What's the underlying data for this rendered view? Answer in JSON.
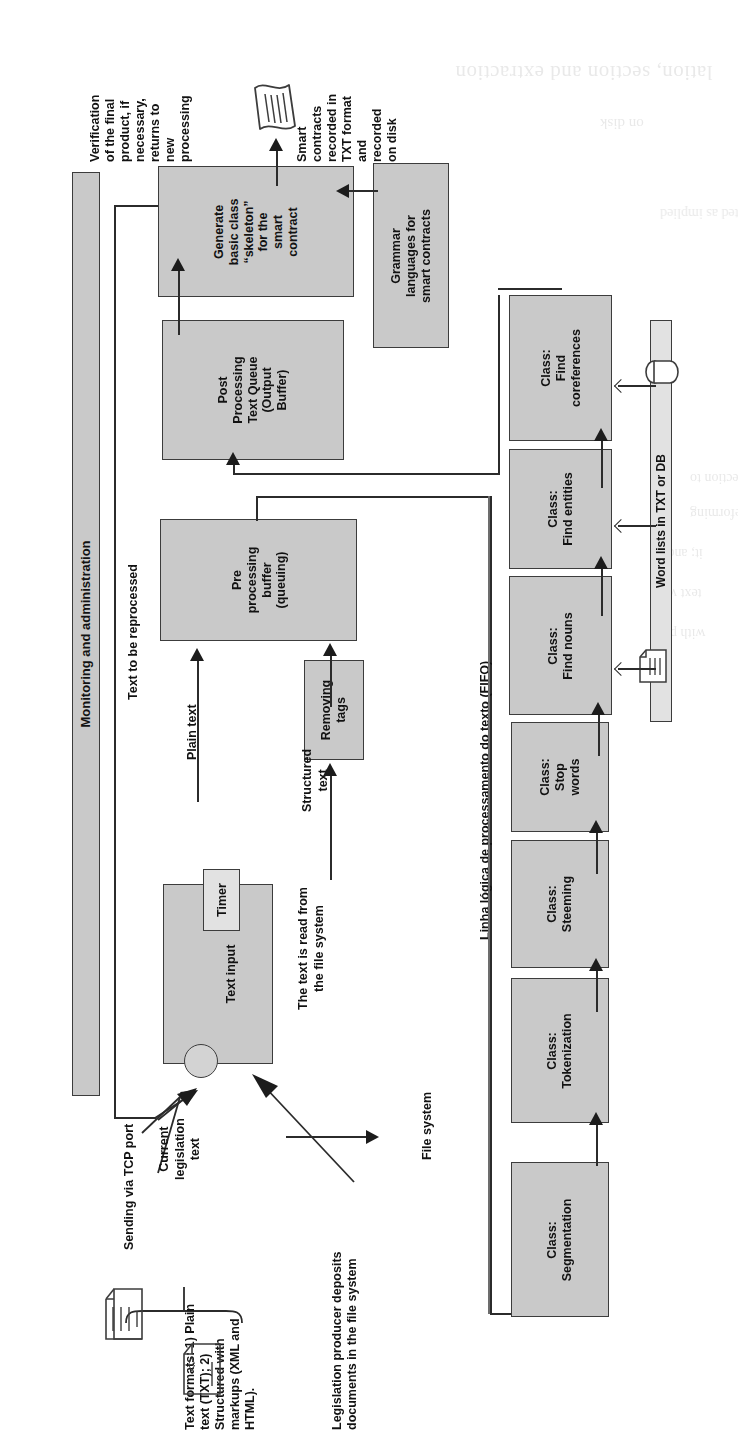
{
  "figure": {
    "orientation": "rotated-90-ccw",
    "kind": "architecture-flow-diagram",
    "colors": {
      "box_fill": "#c9c9c9",
      "box_light_fill": "#e2e2e2",
      "stroke": "#3c3c3c",
      "text": "#121212",
      "page": "#ffffff"
    }
  },
  "bands": {
    "monitoring": "Monitoring and administration",
    "word_lists": "Word lists in TXT or DB",
    "fifo_line": "Linha lógica de processamento do texto (FIFO)"
  },
  "boxes": {
    "generate_skeleton": "Generate basic class “skeleton” for the smart contract",
    "generate_skeleton_lines": [
      "Generate",
      "basic class",
      "“skeleton”",
      "for the",
      "smart",
      "contract"
    ],
    "grammar_languages_lines": [
      "Grammar",
      "languages for",
      "smart contracts"
    ],
    "post_processing_lines": [
      "Post",
      "Processing",
      "Text Queue",
      "(Output",
      "Buffer)"
    ],
    "pre_processing_lines": [
      "Pre",
      "processing",
      "buffer",
      "(queuing)"
    ],
    "removing_tags_lines": [
      "Removing",
      "tags"
    ],
    "text_input": "Text input",
    "timer": "Timer"
  },
  "classes": [
    {
      "title": "Class:",
      "name": "Find coreferences",
      "lines": [
        "Class:",
        "Find",
        "coreferences"
      ]
    },
    {
      "title": "Class:",
      "name": "Find entities",
      "lines": [
        "Class:",
        "Find entities"
      ]
    },
    {
      "title": "Class:",
      "name": "Find nouns",
      "lines": [
        "Class:",
        "Find nouns"
      ]
    },
    {
      "title": "Class:",
      "name": "Stop words",
      "lines": [
        "Class:",
        "Stop",
        "words"
      ]
    },
    {
      "title": "Class:",
      "name": "Steeming",
      "lines": [
        "Class:",
        "Steeming"
      ]
    },
    {
      "title": "Class:",
      "name": "Tokenization",
      "lines": [
        "Class:",
        "Tokenization"
      ]
    },
    {
      "title": "Class:",
      "name": "Segmentation",
      "lines": [
        "Class:",
        "Segmentation"
      ]
    }
  ],
  "annotations": {
    "verification": "Verification of the final product, if necessary, returns to new processing",
    "verification_lines": [
      "Verification",
      "of the final",
      "product, if",
      "necessary,",
      "returns to",
      "new",
      "processing"
    ],
    "smart_contracts_output": "Smart contracts recorded in TXT format and recorded on disk",
    "smart_contracts_output_lines": [
      "Smart",
      "contracts",
      "recorded in",
      "TXT format",
      "and",
      "recorded",
      "on disk"
    ],
    "text_to_be_reprocessed": "Text to be reprocessed",
    "plain_text": "Plain text",
    "structured_text_lines": [
      "Structured",
      "text"
    ],
    "text_read_from_fs_lines": [
      "The text is read from",
      "the file system"
    ],
    "sending_via_tcp": "Sending via TCP port",
    "current_legislation_text_lines": [
      "Current",
      "legislation",
      "text"
    ],
    "text_formats_lines": [
      "Text formats: 1) Plain",
      "text (TXT); 2)",
      "Structured with",
      "markups (XML and",
      "HTML)."
    ],
    "legislation_producer_lines": [
      "Legislation producer deposits",
      "documents in the file system"
    ],
    "file_system": "File system"
  },
  "icons": {
    "smart_contract_scroll": "scroll-document-icon",
    "plain_text_file": "text-file-icon",
    "markup_file": "xml-file-icon",
    "database_cylinder": "database-cylinder-icon",
    "word_list_file": "text-file-icon"
  },
  "bleed_text": [
    "lation, section and extraction",
    "on disk",
    "ns depicted as implied",
    "XT, populations: selection to",
    "extracting pears reforming",
    "it; and t",
    "text wo",
    "with ple"
  ]
}
